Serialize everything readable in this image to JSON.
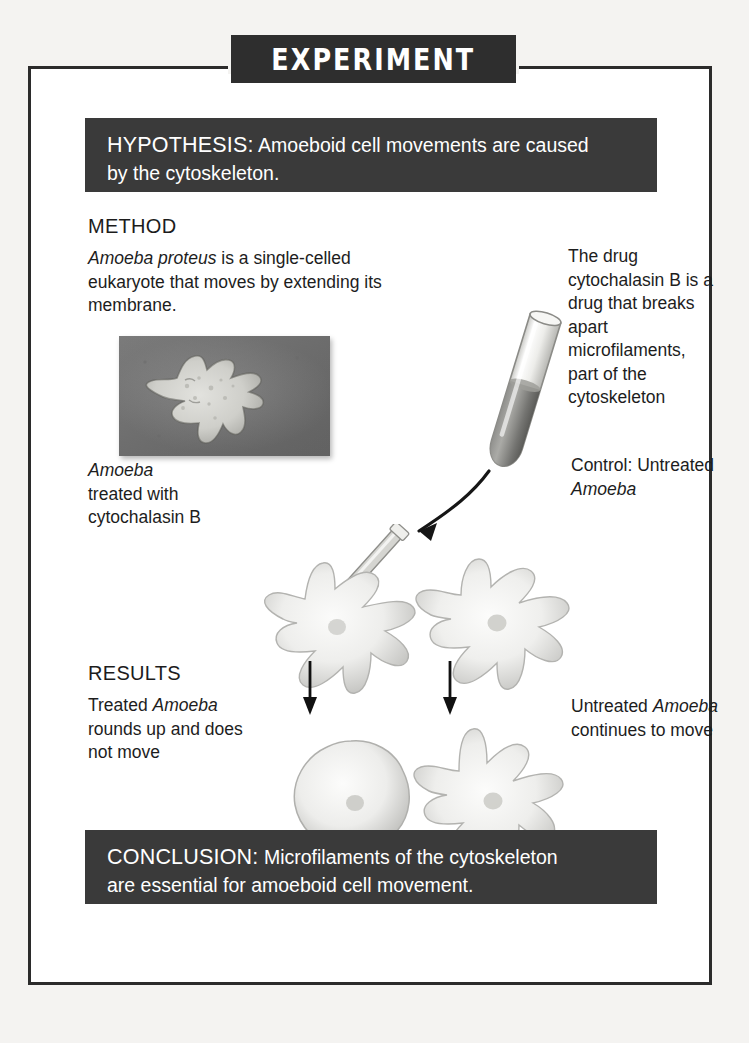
{
  "banner": {
    "title": "EXPERIMENT"
  },
  "hypothesis": {
    "keyword": "HYPOTHESIS:",
    "line1": " Amoeboid cell movements are caused",
    "line2": "by the cytoskeleton."
  },
  "conclusion": {
    "keyword": "CONCLUSION:",
    "line1": " Microfilaments of the cytoskeleton",
    "line2": "are essential for amoeboid cell movement."
  },
  "method": {
    "heading": "METHOD",
    "species": "Amoeba proteus",
    "description_rest": " is a single-celled eukaryote that moves by extending its membrane.",
    "drug_note": "The drug cytochalasin B is a drug that breaks apart microfilaments, part of the cytoskeleton",
    "treated_label_species": "Amoeba",
    "treated_label_rest": "treated with cytochalasin B",
    "control_label_pre": "Control: Untreated ",
    "control_label_species": "Amoeba"
  },
  "results": {
    "heading": "RESULTS",
    "treated_pre": "Treated ",
    "treated_species": "Amoeba",
    "treated_rest": " rounds up and does not move",
    "untreated_pre": "Untreated ",
    "untreated_species": "Amoeba",
    "untreated_rest": " continues to move"
  },
  "figures": {
    "micrograph": "amoeba-micrograph",
    "test_tube": "test-tube-with-drug",
    "pipette": "pipette-icon",
    "transfer_arrow": "curved-arrow-icon",
    "amoeba_treated_method": "amoeba-treated-illustration",
    "amoeba_control_method": "amoeba-control-illustration",
    "amoeba_treated_result": "amoeba-rounded-illustration",
    "amoeba_untreated_result": "amoeba-motile-illustration",
    "down_arrow_left": "down-arrow-icon",
    "down_arrow_right": "down-arrow-icon"
  },
  "colors": {
    "bar_background": "#3a3a3a",
    "frame": "#2b2b2b",
    "page": "#f4f3f1",
    "text": "#1d1d1d"
  }
}
